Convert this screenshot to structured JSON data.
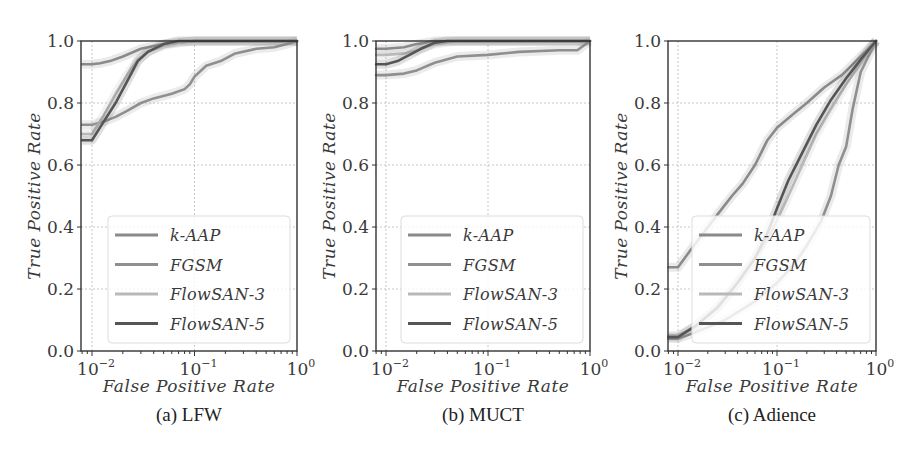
{
  "figure": {
    "captions": [
      "(a) LFW",
      "(b) MUCT",
      "(c) Adience"
    ]
  },
  "chart_data": [
    {
      "type": "line",
      "title": "(a) LFW",
      "xlabel": "False Positive Rate",
      "ylabel": "True Positive Rate",
      "xscale": "log",
      "xlim": [
        0.008,
        1.0
      ],
      "ylim": [
        0.0,
        1.0
      ],
      "xticks": [
        "10^-2",
        "10^-1",
        "10^0"
      ],
      "yticks": [
        "0.0",
        "0.2",
        "0.4",
        "0.6",
        "0.8",
        "1.0"
      ],
      "grid": true,
      "legend_position": "lower right",
      "series": [
        {
          "name": "k-AAP",
          "color": "#8a8a8a",
          "width": 2.6,
          "x": [
            0.008,
            0.01,
            0.012,
            0.015,
            0.02,
            0.03,
            0.05,
            0.1,
            1.0
          ],
          "y": [
            0.925,
            0.925,
            0.928,
            0.935,
            0.95,
            0.975,
            0.99,
            1.0,
            1.0
          ]
        },
        {
          "name": "FGSM",
          "color": "#8f8f8f",
          "width": 2.6,
          "x": [
            0.008,
            0.01,
            0.013,
            0.017,
            0.022,
            0.03,
            0.04,
            0.06,
            0.08,
            0.09,
            0.1,
            0.13,
            0.18,
            0.25,
            0.4,
            0.6,
            0.8,
            1.0
          ],
          "y": [
            0.73,
            0.73,
            0.74,
            0.755,
            0.775,
            0.8,
            0.815,
            0.83,
            0.845,
            0.86,
            0.885,
            0.92,
            0.935,
            0.96,
            0.975,
            0.98,
            0.99,
            1.0
          ]
        },
        {
          "name": "FlowSAN-3",
          "color": "#b9b9b9",
          "width": 2.6,
          "x": [
            0.008,
            0.01,
            0.013,
            0.017,
            0.022,
            0.028,
            0.035,
            0.05,
            0.07,
            0.1,
            1.0
          ],
          "y": [
            0.7,
            0.7,
            0.76,
            0.83,
            0.89,
            0.94,
            0.965,
            0.985,
            0.995,
            1.0,
            1.0
          ]
        },
        {
          "name": "FlowSAN-5",
          "color": "#555555",
          "width": 2.6,
          "x": [
            0.008,
            0.01,
            0.013,
            0.017,
            0.022,
            0.028,
            0.035,
            0.05,
            0.07,
            0.1,
            1.0
          ],
          "y": [
            0.68,
            0.68,
            0.74,
            0.8,
            0.87,
            0.935,
            0.965,
            0.99,
            1.0,
            1.0,
            1.0
          ]
        }
      ]
    },
    {
      "type": "line",
      "title": "(b) MUCT",
      "xlabel": "False Positive Rate",
      "ylabel": "True Positive Rate",
      "xscale": "log",
      "xlim": [
        0.008,
        1.0
      ],
      "ylim": [
        0.0,
        1.0
      ],
      "xticks": [
        "10^-2",
        "10^-1",
        "10^0"
      ],
      "yticks": [
        "0.0",
        "0.2",
        "0.4",
        "0.6",
        "0.8",
        "1.0"
      ],
      "grid": true,
      "legend_position": "lower right",
      "series": [
        {
          "name": "k-AAP",
          "color": "#8a8a8a",
          "width": 2.6,
          "x": [
            0.008,
            0.01,
            0.015,
            0.02,
            0.03,
            1.0
          ],
          "y": [
            0.975,
            0.975,
            0.98,
            0.99,
            1.0,
            1.0
          ]
        },
        {
          "name": "FGSM",
          "color": "#8f8f8f",
          "width": 2.6,
          "x": [
            0.008,
            0.01,
            0.015,
            0.02,
            0.03,
            0.05,
            0.1,
            0.2,
            0.5,
            0.75,
            1.0
          ],
          "y": [
            0.89,
            0.89,
            0.895,
            0.905,
            0.93,
            0.95,
            0.955,
            0.965,
            0.97,
            0.97,
            1.0
          ]
        },
        {
          "name": "FlowSAN-3",
          "color": "#b9b9b9",
          "width": 2.6,
          "x": [
            0.008,
            0.01,
            0.015,
            0.02,
            0.03,
            0.05,
            1.0
          ],
          "y": [
            0.955,
            0.955,
            0.96,
            0.97,
            0.99,
            1.0,
            1.0
          ]
        },
        {
          "name": "FlowSAN-5",
          "color": "#555555",
          "width": 2.6,
          "x": [
            0.008,
            0.01,
            0.013,
            0.017,
            0.022,
            0.03,
            0.04,
            1.0
          ],
          "y": [
            0.925,
            0.925,
            0.935,
            0.955,
            0.975,
            0.995,
            1.0,
            1.0
          ]
        }
      ]
    },
    {
      "type": "line",
      "title": "(c) Adience",
      "xlabel": "False Positive Rate",
      "ylabel": "True Positive Rate",
      "xscale": "log",
      "xlim": [
        0.008,
        1.0
      ],
      "ylim": [
        0.0,
        1.0
      ],
      "xticks": [
        "10^-2",
        "10^-1",
        "10^0"
      ],
      "yticks": [
        "0.0",
        "0.2",
        "0.4",
        "0.6",
        "0.8",
        "1.0"
      ],
      "grid": true,
      "legend_position": "lower right",
      "series": [
        {
          "name": "k-AAP",
          "color": "#8a8a8a",
          "width": 2.6,
          "x": [
            0.008,
            0.01,
            0.013,
            0.018,
            0.025,
            0.035,
            0.045,
            0.06,
            0.08,
            0.1,
            0.14,
            0.2,
            0.3,
            0.45,
            0.65,
            1.0
          ],
          "y": [
            0.27,
            0.27,
            0.32,
            0.38,
            0.44,
            0.5,
            0.54,
            0.6,
            0.68,
            0.72,
            0.76,
            0.8,
            0.85,
            0.89,
            0.94,
            1.0
          ]
        },
        {
          "name": "FGSM",
          "color": "#8f8f8f",
          "width": 2.6,
          "x": [
            0.008,
            0.01,
            0.015,
            0.03,
            0.06,
            0.1,
            0.15,
            0.2,
            0.28,
            0.35,
            0.42,
            0.5,
            0.58,
            0.7,
            1.0
          ],
          "y": [
            0.04,
            0.04,
            0.06,
            0.1,
            0.16,
            0.22,
            0.28,
            0.34,
            0.42,
            0.5,
            0.6,
            0.66,
            0.78,
            0.9,
            1.0
          ]
        },
        {
          "name": "FlowSAN-3",
          "color": "#b9b9b9",
          "width": 2.6,
          "x": [
            0.008,
            0.01,
            0.015,
            0.025,
            0.04,
            0.06,
            0.08,
            0.1,
            0.13,
            0.18,
            0.25,
            0.35,
            0.5,
            0.7,
            1.0
          ],
          "y": [
            0.05,
            0.05,
            0.08,
            0.14,
            0.22,
            0.3,
            0.36,
            0.42,
            0.5,
            0.6,
            0.7,
            0.78,
            0.86,
            0.93,
            1.0
          ]
        },
        {
          "name": "FlowSAN-5",
          "color": "#555555",
          "width": 2.6,
          "x": [
            0.008,
            0.01,
            0.015,
            0.025,
            0.04,
            0.06,
            0.08,
            0.1,
            0.13,
            0.18,
            0.25,
            0.35,
            0.5,
            0.7,
            1.0
          ],
          "y": [
            0.045,
            0.045,
            0.08,
            0.14,
            0.22,
            0.3,
            0.38,
            0.46,
            0.55,
            0.64,
            0.73,
            0.81,
            0.88,
            0.94,
            1.0
          ]
        }
      ]
    }
  ],
  "panels_layout": [
    {
      "id": "a",
      "axis_left": 81,
      "decade_origin_x": 92,
      "decade_px": 102.5,
      "axis_right": 297,
      "ylabel_x": 40,
      "legend": {
        "x": 108,
        "y": 216,
        "w": 182,
        "h": 127
      },
      "caption_x": 190,
      "xlabel_x": 190
    },
    {
      "id": "b",
      "axis_left": 376,
      "decade_origin_x": 386,
      "decade_px": 102,
      "axis_right": 590,
      "ylabel_x": 335,
      "legend": {
        "x": 401,
        "y": 216,
        "w": 182,
        "h": 127
      },
      "caption_x": 483,
      "xlabel_x": 483
    },
    {
      "id": "c",
      "axis_left": 668,
      "decade_origin_x": 678,
      "decade_px": 99,
      "axis_right": 876,
      "ylabel_x": 627,
      "legend": {
        "x": 692,
        "y": 216,
        "w": 178,
        "h": 127
      },
      "caption_x": 772,
      "xlabel_x": 772
    }
  ]
}
